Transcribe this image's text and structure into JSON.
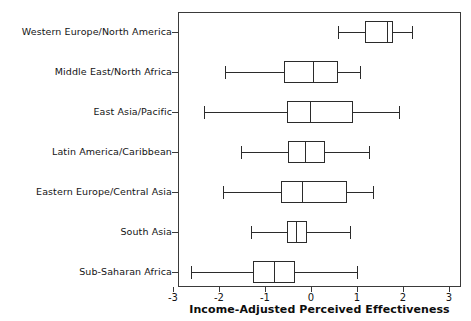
{
  "chart_data": {
    "type": "box",
    "title": "",
    "xlabel": "Income-Adjusted Perceived Effectiveness",
    "ylabel": "",
    "xlim": [
      -3.35,
      3.35
    ],
    "xticks": [
      -3,
      -2,
      -1,
      0,
      1,
      2,
      3
    ],
    "xticklabels": [
      "-3",
      "-2",
      "-1",
      "0",
      "1",
      "2",
      "3"
    ],
    "grid": false,
    "legend": null,
    "orientation": "horizontal",
    "categories": [
      "Western Europe/North America",
      "Middle East/North Africa",
      "East Asia/Pacific",
      "Latin America/Caribbean",
      "Eastern Europe/Central Asia",
      "South Asia",
      "Sub-Saharan Africa"
    ],
    "boxes": [
      {
        "category": "Western Europe/North America",
        "whisker_low": 0.59,
        "q1": 1.17,
        "median": 1.65,
        "q3": 1.78,
        "whisker_high": 2.2
      },
      {
        "category": "Middle East/North Africa",
        "whisker_low": -1.87,
        "q1": -0.59,
        "median": 0.04,
        "q3": 0.59,
        "whisker_high": 1.07
      },
      {
        "category": "East Asia/Pacific",
        "whisker_low": -2.33,
        "q1": -0.52,
        "median": -0.02,
        "q3": 0.91,
        "whisker_high": 1.91
      },
      {
        "category": "Latin America/Caribbean",
        "whisker_low": -1.52,
        "q1": -0.5,
        "median": -0.13,
        "q3": 0.3,
        "whisker_high": 1.26
      },
      {
        "category": "Eastern Europe/Central Asia",
        "whisker_low": -1.91,
        "q1": -0.65,
        "median": -0.2,
        "q3": 0.78,
        "whisker_high": 1.35
      },
      {
        "category": "South Asia",
        "whisker_low": -1.3,
        "q1": -0.52,
        "median": -0.33,
        "q3": -0.09,
        "whisker_high": 0.85
      },
      {
        "category": "Sub-Saharan Africa",
        "whisker_low": -2.61,
        "q1": -1.26,
        "median": -0.8,
        "q3": -0.35,
        "whisker_high": 1.0
      }
    ],
    "colors": {
      "line": "#2b2b2b",
      "frame": "#3a3a3a",
      "background": "#ffffff",
      "text": "#141414"
    }
  }
}
